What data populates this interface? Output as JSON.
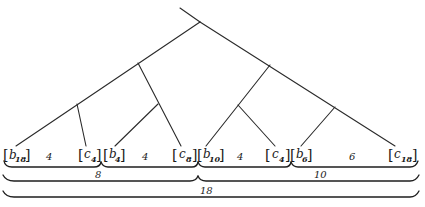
{
  "diagram": {
    "title": "",
    "type": "tree-with-interval-braces",
    "leaves": [
      {
        "id": "b18",
        "letter": "b",
        "subscript": "18",
        "x": 10
      },
      {
        "id": "c4a",
        "letter": "c",
        "subscript": "4",
        "x": 86
      },
      {
        "id": "b4",
        "letter": "b",
        "subscript": "4",
        "x": 108
      },
      {
        "id": "c8",
        "letter": "c",
        "subscript": "8",
        "x": 180
      },
      {
        "id": "b10",
        "letter": "b",
        "subscript": "10",
        "x": 203
      },
      {
        "id": "c4b",
        "letter": "c",
        "subscript": "4",
        "x": 270
      },
      {
        "id": "b6",
        "letter": "b",
        "subscript": "6",
        "x": 294
      },
      {
        "id": "c18",
        "letter": "c",
        "subscript": "18",
        "x": 390
      }
    ],
    "segment_counts": [
      {
        "from": "b18",
        "to": "c4a",
        "value": "4",
        "x": 49
      },
      {
        "from": "b4",
        "to": "c8",
        "value": "4",
        "x": 145
      },
      {
        "from": "b10",
        "to": "c4b",
        "value": "4",
        "x": 240
      },
      {
        "from": "b6",
        "to": "c18",
        "value": "6",
        "x": 352
      }
    ],
    "braces": [
      {
        "level": 1,
        "label": "",
        "x1": 3,
        "x2": 101
      },
      {
        "level": 1,
        "label": "",
        "x1": 101,
        "x2": 198
      },
      {
        "level": 1,
        "label": "",
        "x1": 198,
        "x2": 291
      },
      {
        "level": 1,
        "label": "",
        "x1": 291,
        "x2": 418
      },
      {
        "level": 2,
        "label": "8",
        "x1": 3,
        "x2": 198,
        "label_x": 98
      },
      {
        "level": 2,
        "label": "10",
        "x1": 198,
        "x2": 418,
        "label_x": 320
      },
      {
        "level": 3,
        "label": "18",
        "x1": 3,
        "x2": 418,
        "label_x": 206
      }
    ],
    "line_color": "#2a2a2a",
    "text_color": "#1a1a1a",
    "background": "#ffffff"
  }
}
